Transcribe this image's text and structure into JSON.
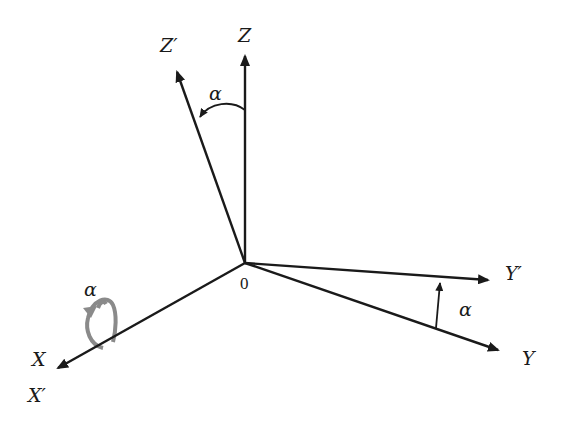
{
  "diagram": {
    "origin": {
      "label": "0",
      "x": 245,
      "y": 263
    },
    "axes": [
      {
        "id": "Z",
        "label": "Z",
        "tip": [
          245,
          52
        ]
      },
      {
        "id": "Zp",
        "label": "Z′",
        "tip": [
          175,
          68
        ]
      },
      {
        "id": "Y",
        "label": "Y",
        "tip": [
          502,
          352
        ]
      },
      {
        "id": "Yp",
        "label": "Y′",
        "tip": [
          492,
          280
        ]
      },
      {
        "id": "X",
        "label": "X",
        "tip": [
          55,
          370
        ]
      }
    ],
    "labels": {
      "z": "Z",
      "z_prime": "Z′",
      "y": "Y",
      "y_prime": "Y′",
      "x": "X",
      "x_prime": "X′",
      "origin": "0",
      "alpha_top": "α",
      "alpha_right": "α",
      "alpha_rotation": "α"
    },
    "colors": {
      "axis": "#1a1a1a",
      "rotation_arrow": "#8a8a8a",
      "background": "#ffffff"
    }
  }
}
